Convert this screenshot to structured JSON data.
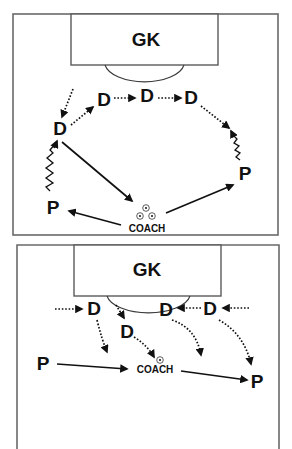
{
  "diagrams": [
    {
      "id": "top",
      "goalkeeper_label": "GK",
      "players": [
        {
          "label": "D",
          "x": 60,
          "y": 135
        },
        {
          "label": "D",
          "x": 104,
          "y": 106
        },
        {
          "label": "D",
          "x": 147,
          "y": 101
        },
        {
          "label": "D",
          "x": 191,
          "y": 103
        },
        {
          "label": "P",
          "x": 245,
          "y": 180
        },
        {
          "label": "P",
          "x": 53,
          "y": 214
        }
      ],
      "coach_label": "COACH",
      "movement_legend": {
        "dotted": "player run",
        "solid": "pass",
        "zigzag": "dribble"
      }
    },
    {
      "id": "bottom",
      "goalkeeper_label": "GK",
      "players": [
        {
          "label": "D",
          "x": 94,
          "y": 315
        },
        {
          "label": "D",
          "x": 125,
          "y": 338
        },
        {
          "label": "D",
          "x": 166,
          "y": 315
        },
        {
          "label": "D",
          "x": 210,
          "y": 315
        },
        {
          "label": "P",
          "x": 43,
          "y": 369
        },
        {
          "label": "P",
          "x": 257,
          "y": 387
        }
      ],
      "coach_label": "COACH"
    }
  ],
  "colors": {
    "line": "#111111",
    "field_border": "#6a6a6a",
    "background": "#ffffff"
  }
}
